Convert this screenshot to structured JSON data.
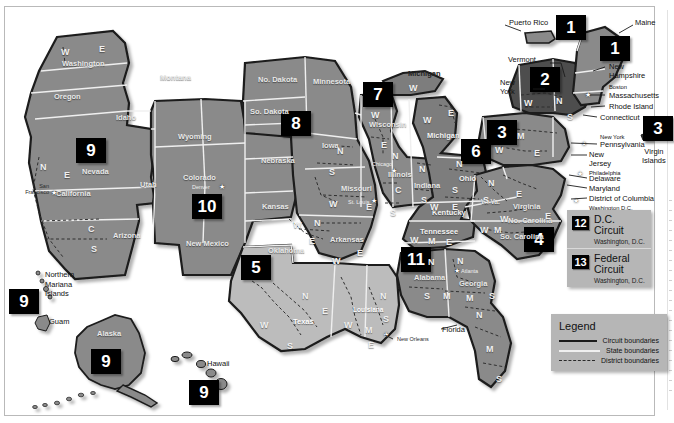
{
  "map": {
    "title": "United States Courts of Appeals and United States District Courts",
    "colors": {
      "land_main": "#8a8a8a",
      "land_dark": "#5d5d5d",
      "land_light": "#bcbcbc",
      "land_mid": "#9a9a9a",
      "water": "#ffffff",
      "badge_bg": "#000000",
      "badge_fg": "#ffffff",
      "panel_bg": "#b6b6b6",
      "page_bg": "#ffffff",
      "state_border": "#efefef",
      "circuit_border": "#1b1b1b",
      "district_border": "#2a2a2a"
    },
    "circuit_badges": [
      {
        "number": "1",
        "name": "badge-circuit-1-puerto-rico",
        "x": 556,
        "y": 12,
        "size": "lg"
      },
      {
        "number": "1",
        "name": "badge-circuit-1-maine",
        "x": 600,
        "y": 33,
        "size": "lg"
      },
      {
        "number": "2",
        "name": "badge-circuit-2",
        "x": 530,
        "y": 64,
        "size": "lg"
      },
      {
        "number": "3",
        "name": "badge-circuit-3",
        "x": 487,
        "y": 117,
        "size": "lg"
      },
      {
        "number": "3",
        "name": "badge-circuit-3-virgin-islands",
        "x": 643,
        "y": 113,
        "size": "lg"
      },
      {
        "number": "4",
        "name": "badge-circuit-4",
        "x": 524,
        "y": 224,
        "size": "lg"
      },
      {
        "number": "5",
        "name": "badge-circuit-5",
        "x": 241,
        "y": 252,
        "size": "lg"
      },
      {
        "number": "6",
        "name": "badge-circuit-6",
        "x": 461,
        "y": 136,
        "size": "lg"
      },
      {
        "number": "7",
        "name": "badge-circuit-7",
        "x": 363,
        "y": 79,
        "size": "lg"
      },
      {
        "number": "8",
        "name": "badge-circuit-8",
        "x": 281,
        "y": 108,
        "size": "lg"
      },
      {
        "number": "9",
        "name": "badge-circuit-9-west",
        "x": 76,
        "y": 135,
        "size": "lg"
      },
      {
        "number": "9",
        "name": "badge-circuit-9-pacific",
        "x": 8,
        "y": 286,
        "size": "lg"
      },
      {
        "number": "9",
        "name": "badge-circuit-9-alaska",
        "x": 90,
        "y": 346,
        "size": "lg"
      },
      {
        "number": "9",
        "name": "badge-circuit-9-hawaii",
        "x": 188,
        "y": 377,
        "size": "lg"
      },
      {
        "number": "10",
        "name": "badge-circuit-10",
        "x": 192,
        "y": 191,
        "size": "lg"
      },
      {
        "number": "11",
        "name": "badge-circuit-11",
        "x": 401,
        "y": 244,
        "size": "lg"
      }
    ],
    "info_panel": {
      "name": "circuit-info-panel",
      "rows": [
        {
          "number": "12",
          "title": "D.C. Circuit",
          "subtitle": "Washington, D.C."
        },
        {
          "number": "13",
          "title": "Federal Circuit",
          "subtitle": "Washington, D.C."
        }
      ]
    },
    "legend": {
      "title": "Legend",
      "items": [
        {
          "label": "Circuit boundaries",
          "style": "solid-black",
          "key": "circuit"
        },
        {
          "label": "State boundaries",
          "style": "solid-white",
          "key": "state"
        },
        {
          "label": "District boundaries",
          "style": "dashed",
          "key": "district"
        }
      ]
    },
    "state_labels": [
      {
        "text": "Washington",
        "x": 62,
        "y": 56,
        "tone": ""
      },
      {
        "text": "Oregon",
        "x": 54,
        "y": 89,
        "tone": ""
      },
      {
        "text": "Montana",
        "x": 160,
        "y": 70,
        "tone": ""
      },
      {
        "text": "Idaho",
        "x": 116,
        "y": 110,
        "tone": ""
      },
      {
        "text": "Wyoming",
        "x": 178,
        "y": 129,
        "tone": ""
      },
      {
        "text": "Nevada",
        "x": 82,
        "y": 164,
        "tone": ""
      },
      {
        "text": "Utah",
        "x": 140,
        "y": 177,
        "tone": ""
      },
      {
        "text": "Colorado",
        "x": 183,
        "y": 170,
        "tone": ""
      },
      {
        "text": "California",
        "x": 56,
        "y": 186,
        "tone": ""
      },
      {
        "text": "Arizona",
        "x": 113,
        "y": 228,
        "tone": ""
      },
      {
        "text": "New Mexico",
        "x": 186,
        "y": 240,
        "tone": ""
      },
      {
        "text": "No. Dakota",
        "x": 258,
        "y": 72,
        "tone": ""
      },
      {
        "text": "So. Dakota",
        "x": 250,
        "y": 108,
        "tone": ""
      },
      {
        "text": "Nebraska",
        "x": 261,
        "y": 153,
        "tone": ""
      },
      {
        "text": "Kansas",
        "x": 262,
        "y": 199,
        "tone": ""
      },
      {
        "text": "Oklahoma",
        "x": 268,
        "y": 243,
        "tone": ""
      },
      {
        "text": "Texas",
        "x": 293,
        "y": 314,
        "tone": "onlight"
      },
      {
        "text": "Minnesota",
        "x": 313,
        "y": 74,
        "tone": ""
      },
      {
        "text": "Iowa",
        "x": 322,
        "y": 138,
        "tone": ""
      },
      {
        "text": "Missouri",
        "x": 341,
        "y": 181,
        "tone": ""
      },
      {
        "text": "Arkansas",
        "x": 330,
        "y": 232,
        "tone": ""
      },
      {
        "text": "Louisiana",
        "x": 355,
        "y": 303,
        "tone": "onlight"
      },
      {
        "text": "Wisconsin",
        "x": 369,
        "y": 117,
        "tone": ""
      },
      {
        "text": "Illinois",
        "x": 387,
        "y": 167,
        "tone": ""
      },
      {
        "text": "Indiana",
        "x": 414,
        "y": 178,
        "tone": ""
      },
      {
        "text": "Michigan",
        "x": 408,
        "y": 66,
        "tone": ""
      },
      {
        "text": "Michigan",
        "x": 427,
        "y": 128,
        "tone": "dark"
      },
      {
        "text": "Ohio",
        "x": 459,
        "y": 171,
        "tone": ""
      },
      {
        "text": "Kentucky",
        "x": 432,
        "y": 205,
        "tone": ""
      },
      {
        "text": "Tennessee",
        "x": 420,
        "y": 224,
        "tone": ""
      },
      {
        "text": "Alabama",
        "x": 414,
        "y": 270,
        "tone": ""
      },
      {
        "text": "Georgia",
        "x": 459,
        "y": 276,
        "tone": ""
      },
      {
        "text": "W. Va.",
        "x": 481,
        "y": 195,
        "tone": ""
      },
      {
        "text": "Virginia",
        "x": 513,
        "y": 199,
        "tone": ""
      },
      {
        "text": "No. Carolina",
        "x": 508,
        "y": 213,
        "tone": ""
      },
      {
        "text": "So. Carolina",
        "x": 500,
        "y": 234,
        "tone": ""
      }
    ],
    "division_letters": [
      {
        "text": "W",
        "x": 56,
        "y": 44
      },
      {
        "text": "E",
        "x": 94,
        "y": 41
      },
      {
        "text": "N",
        "x": 35,
        "y": 159
      },
      {
        "text": "E",
        "x": 59,
        "y": 167
      },
      {
        "text": "C",
        "x": 83,
        "y": 221
      },
      {
        "text": "S",
        "x": 86,
        "y": 241
      },
      {
        "text": "N",
        "x": 332,
        "y": 143
      },
      {
        "text": "S",
        "x": 324,
        "y": 164
      },
      {
        "text": "W",
        "x": 324,
        "y": 196
      },
      {
        "text": "E",
        "x": 361,
        "y": 199
      },
      {
        "text": "E",
        "x": 352,
        "y": 245
      },
      {
        "text": "W",
        "x": 327,
        "y": 253
      },
      {
        "text": "W",
        "x": 288,
        "y": 217
      },
      {
        "text": "N",
        "x": 309,
        "y": 215
      },
      {
        "text": "E",
        "x": 304,
        "y": 233
      },
      {
        "text": "W",
        "x": 317,
        "y": 212
      },
      {
        "text": "N",
        "x": 297,
        "y": 288
      },
      {
        "text": "E",
        "x": 317,
        "y": 303
      },
      {
        "text": "W",
        "x": 255,
        "y": 317
      },
      {
        "text": "S",
        "x": 282,
        "y": 338
      },
      {
        "text": "W",
        "x": 339,
        "y": 317
      },
      {
        "text": "M",
        "x": 360,
        "y": 322
      },
      {
        "text": "E",
        "x": 363,
        "y": 337
      },
      {
        "text": "N",
        "x": 375,
        "y": 288
      },
      {
        "text": "S",
        "x": 378,
        "y": 311
      },
      {
        "text": "W",
        "x": 366,
        "y": 107
      },
      {
        "text": "E",
        "x": 376,
        "y": 137
      },
      {
        "text": "N",
        "x": 387,
        "y": 148
      },
      {
        "text": "C",
        "x": 390,
        "y": 182
      },
      {
        "text": "S",
        "x": 385,
        "y": 205
      },
      {
        "text": "N",
        "x": 414,
        "y": 161
      },
      {
        "text": "S",
        "x": 416,
        "y": 192
      },
      {
        "text": "W",
        "x": 404,
        "y": 80
      },
      {
        "text": "W",
        "x": 418,
        "y": 112
      },
      {
        "text": "E",
        "x": 443,
        "y": 105
      },
      {
        "text": "N",
        "x": 451,
        "y": 156
      },
      {
        "text": "S",
        "x": 447,
        "y": 182
      },
      {
        "text": "E",
        "x": 447,
        "y": 199
      },
      {
        "text": "W",
        "x": 425,
        "y": 199
      },
      {
        "text": "E",
        "x": 447,
        "y": 214
      },
      {
        "text": "W",
        "x": 405,
        "y": 232
      },
      {
        "text": "M",
        "x": 423,
        "y": 233
      },
      {
        "text": "E",
        "x": 441,
        "y": 234
      },
      {
        "text": "N",
        "x": 423,
        "y": 254
      },
      {
        "text": "N",
        "x": 452,
        "y": 253
      },
      {
        "text": "S",
        "x": 419,
        "y": 288
      },
      {
        "text": "M",
        "x": 438,
        "y": 288
      },
      {
        "text": "M",
        "x": 461,
        "y": 290
      },
      {
        "text": "S",
        "x": 484,
        "y": 288
      },
      {
        "text": "N",
        "x": 471,
        "y": 307
      },
      {
        "text": "M",
        "x": 481,
        "y": 341
      },
      {
        "text": "S",
        "x": 491,
        "y": 371
      },
      {
        "text": "N",
        "x": 483,
        "y": 175
      },
      {
        "text": "S",
        "x": 478,
        "y": 192
      },
      {
        "text": "E",
        "x": 511,
        "y": 186
      },
      {
        "text": "W",
        "x": 495,
        "y": 211
      },
      {
        "text": "M",
        "x": 489,
        "y": 222
      },
      {
        "text": "W",
        "x": 475,
        "y": 222
      },
      {
        "text": "E",
        "x": 540,
        "y": 208
      },
      {
        "text": "M",
        "x": 512,
        "y": 128
      },
      {
        "text": "W",
        "x": 490,
        "y": 142
      },
      {
        "text": "E",
        "x": 529,
        "y": 145
      },
      {
        "text": "W",
        "x": 519,
        "y": 95
      },
      {
        "text": "N",
        "x": 551,
        "y": 93
      },
      {
        "text": "S",
        "x": 562,
        "y": 109
      },
      {
        "text": "M",
        "x": 531,
        "y": 118
      },
      {
        "text": "W",
        "x": 227,
        "y": 328
      }
    ],
    "city_labels": [
      {
        "text": "San\nFrancisco",
        "x": 13,
        "y": 180,
        "tone": ""
      },
      {
        "text": "Denver",
        "x": 192,
        "y": 181,
        "tone": "light"
      },
      {
        "text": "Chicago",
        "x": 372,
        "y": 158,
        "tone": "light"
      },
      {
        "text": "St. Louis",
        "x": 348,
        "y": 196,
        "tone": "light"
      },
      {
        "text": "Atlanta",
        "x": 460,
        "y": 265,
        "tone": "light"
      },
      {
        "text": "Boston",
        "x": 601,
        "y": 78,
        "tone": ""
      },
      {
        "text": "New York",
        "x": 597,
        "y": 130,
        "tone": ""
      },
      {
        "text": "Philadelphia",
        "x": 589,
        "y": 167,
        "tone": ""
      },
      {
        "text": "Washington D.C.",
        "x": 589,
        "y": 192,
        "tone": ""
      },
      {
        "text": "Richmond",
        "x": 589,
        "y": 203,
        "tone": ""
      },
      {
        "text": "New Orleans",
        "x": 392,
        "y": 333,
        "tone": ""
      }
    ],
    "callout_labels": [
      {
        "text": "Puerto Rico",
        "x": 509,
        "y": 16
      },
      {
        "text": "Maine",
        "x": 635,
        "y": 16
      },
      {
        "text": "Vermont",
        "x": 508,
        "y": 53
      },
      {
        "text": "New\nYork",
        "x": 500,
        "y": 80
      },
      {
        "text": "New\nHampshire",
        "x": 609,
        "y": 60
      },
      {
        "text": "Massachusetts",
        "x": 609,
        "y": 89
      },
      {
        "text": "Rhode Island",
        "x": 609,
        "y": 100
      },
      {
        "text": "Connecticut",
        "x": 600,
        "y": 111
      },
      {
        "text": "Pennsylvania",
        "x": 600,
        "y": 138
      },
      {
        "text": "New\nJersey",
        "x": 589,
        "y": 148
      },
      {
        "text": "Delaware",
        "x": 589,
        "y": 172
      },
      {
        "text": "Maryland",
        "x": 589,
        "y": 182
      },
      {
        "text": "District of Columbia",
        "x": 589,
        "y": 183
      },
      {
        "text": "Virgin\nIslands",
        "x": 637,
        "y": 145
      },
      {
        "text": "Northern\nMariana\nIslands",
        "x": 45,
        "y": 268
      },
      {
        "text": "Guam",
        "x": 49,
        "y": 314
      },
      {
        "text": "Alaska",
        "x": 96,
        "y": 325
      },
      {
        "text": "Hawaii",
        "x": 206,
        "y": 356
      },
      {
        "text": "Florida",
        "x": 441,
        "y": 322
      }
    ]
  }
}
